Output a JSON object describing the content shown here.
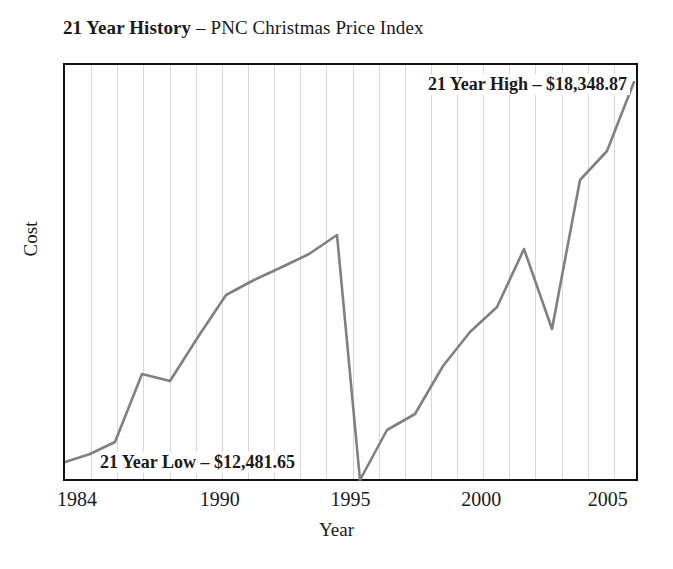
{
  "chart_data": {
    "type": "line",
    "title": "21 Year History – PNC Christmas Price Index",
    "title_bold_part": "21 Year History",
    "title_dash": " – ",
    "title_rest": "PNC Christmas Price Index",
    "xlabel": "Year",
    "ylabel": "Cost",
    "grid": "vertical",
    "legend": "none",
    "line_color": "#808080",
    "frame_color": "#111111",
    "gridline_color": "#d8d8d8",
    "xlim": [
      1984,
      2006
    ],
    "xticks": [
      1984,
      1990,
      1995,
      2000,
      2005
    ],
    "xtick_labels": [
      "1984",
      "1990",
      "1995",
      "2000",
      "2005"
    ],
    "ylim": [
      11500,
      19000
    ],
    "yticks": [],
    "ytick_labels": [],
    "series": [
      {
        "name": "PNC Christmas Price Index",
        "x": [
          1984,
          1985,
          1986,
          1987,
          1988,
          1989,
          1990,
          1991,
          1992,
          1993,
          1994,
          1995,
          1996,
          1997,
          1998,
          1999,
          2000,
          2001,
          2002,
          2003,
          2004,
          2005,
          2006
        ],
        "values": [
          12850,
          13120,
          13380,
          14650,
          14540,
          15600,
          16250,
          16540,
          16760,
          17000,
          17260,
          12482,
          13480,
          13760,
          14180,
          14620,
          15060,
          15520,
          16120,
          15000,
          16620,
          17120,
          18349
        ]
      }
    ],
    "annotations": [
      {
        "name": "high",
        "text": "21 Year High – $18,348.87",
        "value": 18348.87,
        "position": "top-right"
      },
      {
        "name": "low",
        "text": "21 Year Low – $12,481.65",
        "value": 12481.65,
        "position": "bottom-left"
      }
    ],
    "points_px": [
      [
        63,
        460
      ],
      [
        88,
        452
      ],
      [
        113,
        440
      ],
      [
        140,
        372
      ],
      [
        168,
        379
      ],
      [
        196,
        335
      ],
      [
        224,
        293
      ],
      [
        252,
        278
      ],
      [
        280,
        265
      ],
      [
        307,
        252
      ],
      [
        335,
        233
      ],
      [
        358,
        478
      ],
      [
        385,
        428
      ],
      [
        413,
        412
      ],
      [
        441,
        364
      ],
      [
        468,
        330
      ],
      [
        495,
        305
      ],
      [
        522,
        247
      ],
      [
        550,
        327
      ],
      [
        578,
        178
      ],
      [
        605,
        149
      ],
      [
        632,
        80
      ]
    ]
  }
}
